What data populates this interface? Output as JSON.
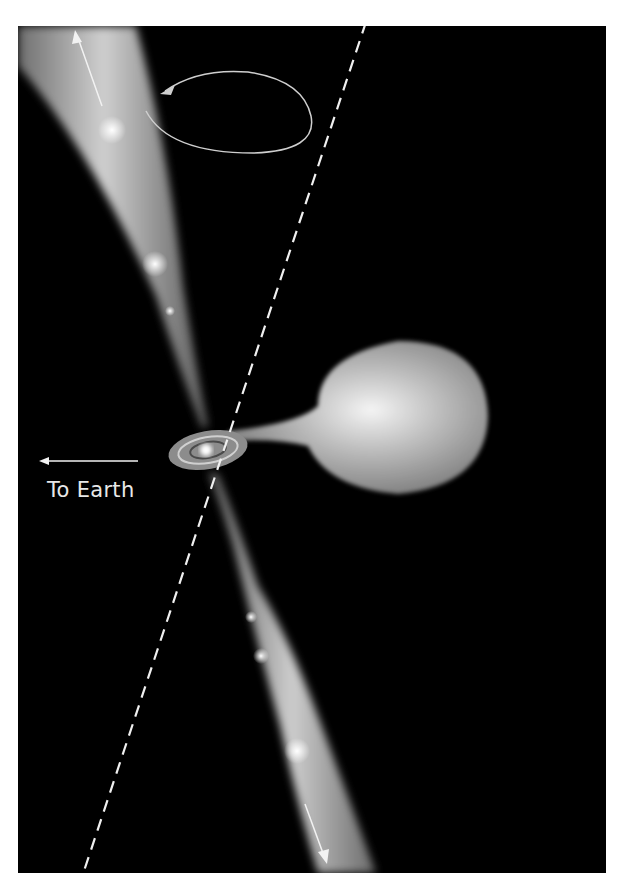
{
  "figure": {
    "labels": {
      "to_earth": "To Earth"
    },
    "elements": {
      "companion_star": "teardrop-shaped donor star transferring mass",
      "accretion_disk": "spiral accretion disk around compact object",
      "jets": [
        "upper jet with knots",
        "lower jet with knots"
      ],
      "precession_arrow": "elliptical arrow indicating jet precession",
      "axis_line": "dashed precession axis",
      "earth_arrow": "arrow pointing left toward Earth",
      "flow_arrows": [
        "upward arrow along upper jet",
        "downward arrow along lower jet"
      ]
    },
    "colors": {
      "background": "#000000",
      "frame": "#ffffff",
      "lines": "#e6e6e6"
    }
  }
}
